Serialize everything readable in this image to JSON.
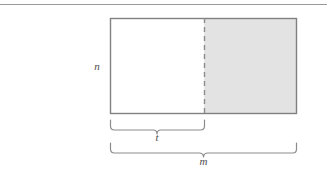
{
  "figure": {
    "background_color": "#ffffff",
    "stroke_color": "#808080",
    "shaded_fill": "#e3e3e3",
    "unshaded_fill": "#ffffff",
    "label_color": "#4d4d4d",
    "top_rule": {
      "name": "top-horizontal-rule",
      "color": "#999999",
      "y": 4,
      "x1": 0,
      "x2": 327
    },
    "rectangle": {
      "x": 110,
      "y": 18,
      "width": 187,
      "height": 96,
      "border_color": "#808080"
    },
    "left_region": {
      "name": "unshaded-region",
      "fill": "#ffffff",
      "x": 110,
      "width": 94
    },
    "right_region": {
      "name": "shaded-region",
      "fill": "#e3e3e3",
      "x": 204,
      "width": 93
    },
    "divider": {
      "name": "dashed-divider",
      "x": 204,
      "y1": 18,
      "y2": 114,
      "style": "dashed",
      "color": "#8c8c8c"
    },
    "labels": {
      "height_label": "n",
      "partial_width_label": "t",
      "total_width_label": "m"
    },
    "label_positions": {
      "height_label": {
        "x": 97,
        "y": 70
      },
      "partial_width_label": {
        "x": 157,
        "y": 138
      },
      "total_width_label": {
        "x": 199,
        "y": 161
      }
    },
    "braces": [
      {
        "name": "brace-partial-width",
        "x1": 110,
        "x2": 204,
        "y": 120,
        "depth": 10,
        "label": "t"
      },
      {
        "name": "brace-total-width",
        "x1": 110,
        "x2": 297,
        "y": 143,
        "depth": 10,
        "label": "m"
      }
    ]
  }
}
